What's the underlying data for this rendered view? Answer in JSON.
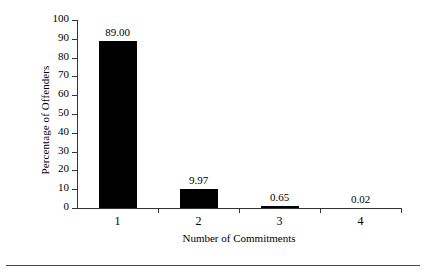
{
  "chart_data": {
    "type": "bar",
    "title": "",
    "xlabel": "Number of Commitments",
    "ylabel": "Percentage of Offenders",
    "categories": [
      "1",
      "2",
      "3",
      "4"
    ],
    "values": [
      89.0,
      9.97,
      0.65,
      0.02
    ],
    "value_labels": [
      "89.00",
      "9.97",
      "0.65",
      "0.02"
    ],
    "ylim": [
      0,
      100
    ],
    "ytick_labels": [
      "0",
      "10",
      "20",
      "30",
      "40",
      "50",
      "60",
      "70",
      "80",
      "90",
      "100"
    ],
    "ytick_values": [
      0,
      10,
      20,
      30,
      40,
      50,
      60,
      70,
      80,
      90,
      100
    ],
    "grid": false,
    "legend": false,
    "bar_color": "#000000",
    "axis_color": "#333333",
    "background": "#ffffff"
  }
}
